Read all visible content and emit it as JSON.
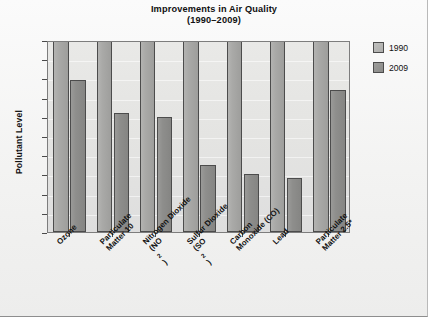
{
  "chart_data": {
    "type": "bar",
    "title": "Improvements in Air Quality",
    "subtitle": "(1990–2009)",
    "title_lines": [
      "Improvements in Air Quality",
      "(1990–2009)"
    ],
    "xlabel": "",
    "ylabel": "Pollutant Level",
    "ylim": [
      0,
      100
    ],
    "ytick_labels": [
      "100",
      "90",
      "80",
      "70",
      "60",
      "50",
      "40",
      "30",
      "20",
      "10",
      "0"
    ],
    "ytick_values": [
      100,
      90,
      80,
      70,
      60,
      50,
      40,
      30,
      20,
      10,
      0
    ],
    "grid": true,
    "legend_position": "right-outside",
    "categories": [
      "Ozone",
      "Particulate Matter 10",
      "Nitrogen Dioxide (NO2)",
      "Sulfur Dioxide (SO2)",
      "Carbon Monoxide (CO)",
      "Lead",
      "Particulate Matter 2.5*"
    ],
    "category_lines": [
      [
        "Ozone"
      ],
      [
        "Particulate",
        "Matter 10"
      ],
      [
        "Nitrogen Dioxide",
        "(NO2)"
      ],
      [
        "Sulfur Dioxide",
        "(SO2)"
      ],
      [
        "Carbon",
        "Monoxide (CO)"
      ],
      [
        "Lead"
      ],
      [
        "Particulate",
        "Matter 2.5*"
      ]
    ],
    "series": [
      {
        "name": "1990",
        "color": "#aaaaa8",
        "values": [
          100,
          100,
          100,
          100,
          100,
          100,
          100
        ]
      },
      {
        "name": "2009",
        "color": "#8e8e8c",
        "values": [
          79,
          62,
          60,
          35,
          30,
          28,
          74
        ]
      }
    ]
  },
  "legend": {
    "items": [
      {
        "label": "1990"
      },
      {
        "label": "2009"
      }
    ]
  }
}
